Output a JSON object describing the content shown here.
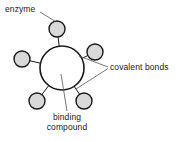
{
  "figure": {
    "type": "diagram",
    "subtype": "enzyme-binding-compound-schematic",
    "background_color": "#ffffff"
  },
  "labels": {
    "enzyme": "enzyme",
    "covalent_bonds": "covalent bonds",
    "binding_compound_line1": "binding",
    "binding_compound_line2": "compound"
  },
  "colors": {
    "stroke": "#1a1a1a",
    "satellite_fill": "#d9d9d9",
    "center_fill": "#ffffff",
    "leader_line": "#555555",
    "text": "#1a1a1a"
  },
  "geometry": {
    "center_node": {
      "cx": 62,
      "cy": 68,
      "r": 22
    },
    "satellites": [
      {
        "name": "top",
        "cx": 57,
        "cy": 29,
        "r": 8
      },
      {
        "name": "left",
        "cx": 22,
        "cy": 59,
        "r": 8
      },
      {
        "name": "upper-right",
        "cx": 95,
        "cy": 52,
        "r": 8
      },
      {
        "name": "lower-left",
        "cx": 37,
        "cy": 101,
        "r": 8
      },
      {
        "name": "lower-right",
        "cx": 84,
        "cy": 101,
        "r": 8
      }
    ],
    "bonds": [
      {
        "from": "center",
        "to": "top"
      },
      {
        "from": "center",
        "to": "left"
      },
      {
        "from": "center",
        "to": "upper-right"
      },
      {
        "from": "center",
        "to": "lower-left"
      },
      {
        "from": "center",
        "to": "lower-right"
      }
    ],
    "leaders": [
      {
        "label": "enzyme",
        "points": "40,12 56,21"
      },
      {
        "label": "covalent_bonds",
        "points": "80,56 108,67"
      },
      {
        "label": "covalent_bonds",
        "points": "77,89 108,69"
      },
      {
        "label": "binding_compound",
        "points": "61,75 67,111"
      }
    ]
  }
}
